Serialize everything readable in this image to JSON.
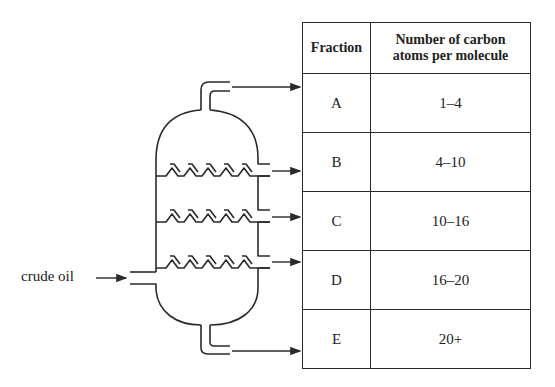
{
  "diagram": {
    "inlet_label": "crude oil",
    "line_color": "#2a2a2a"
  },
  "table": {
    "headers": [
      "Fraction",
      "Number of carbon atoms per molecule"
    ],
    "header_line1": "Number of carbon",
    "header_line2": "atoms per molecule",
    "rows": [
      {
        "fraction": "A",
        "carbon_atoms": "1–4"
      },
      {
        "fraction": "B",
        "carbon_atoms": "4–10"
      },
      {
        "fraction": "C",
        "carbon_atoms": "10–16"
      },
      {
        "fraction": "D",
        "carbon_atoms": "16–20"
      },
      {
        "fraction": "E",
        "carbon_atoms": "20+"
      }
    ]
  }
}
